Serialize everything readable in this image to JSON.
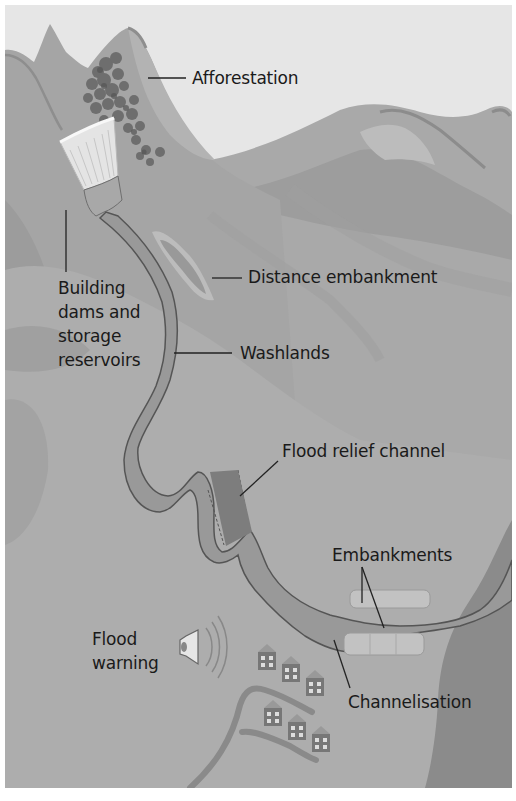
{
  "diagram": {
    "type": "illustrated landscape diagram",
    "colors": {
      "sky": "#e6e6e6",
      "mountain_dark": "#9a9a9a",
      "mountain_mid": "#a8a8a8",
      "mountain_light": "#b4b4b4",
      "valley_floor": "#aeaeae",
      "river": "#959595",
      "river_outline": "#555555",
      "sea": "#8a8a8a",
      "leader_line": "#222222",
      "text": "#1a1a1a"
    },
    "labels": [
      {
        "id": "afforestation",
        "text": "Afforestation"
      },
      {
        "id": "dams",
        "text": "Building\ndams and\nstorage\nreservoirs"
      },
      {
        "id": "distance-embankment",
        "text": "Distance embankment"
      },
      {
        "id": "washlands",
        "text": "Washlands"
      },
      {
        "id": "flood-relief-channel",
        "text": "Flood relief channel"
      },
      {
        "id": "embankments",
        "text": "Embankments"
      },
      {
        "id": "flood-warning",
        "text": "Flood\nwarning"
      },
      {
        "id": "channelisation",
        "text": "Channelisation"
      }
    ],
    "icons": {
      "forest": "tree-cluster-icon",
      "dam": "dam-icon",
      "speaker": "speaker-icon",
      "houses": "house-icon"
    }
  }
}
